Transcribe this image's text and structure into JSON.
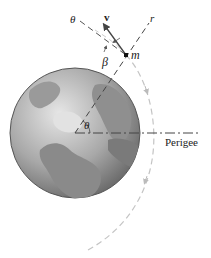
{
  "diagram": {
    "labels": {
      "theta_top": "θ",
      "velocity": "v",
      "radial": "r",
      "mass": "m",
      "beta": "β",
      "theta_center": "θ",
      "perigee": "Perigee"
    },
    "colors": {
      "earth_dark": "#6e6e6e",
      "earth_light": "#d8d8d8",
      "orbit": "#bdbdbd",
      "line": "#444444",
      "text": "#222222"
    },
    "geometry": {
      "earth_center": [
        75,
        133
      ],
      "earth_radius": 65,
      "mass_position": [
        126,
        55
      ]
    }
  }
}
